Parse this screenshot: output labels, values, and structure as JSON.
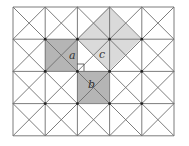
{
  "diagram": {
    "grid": {
      "cols": 5,
      "rows": 4,
      "x0": 13,
      "y0": 7,
      "cell": 32.2,
      "diagonals": true,
      "line_color": "#6e6e6e",
      "dot_color": "#222222"
    },
    "squares": [
      {
        "name": "a",
        "fill": "#b5b5b5",
        "points": "45,39 77,39 77,71 45,71"
      },
      {
        "name": "b",
        "fill": "#b5b5b5",
        "points": "77,71 109,71 109,103 77,103"
      },
      {
        "name": "c",
        "fill": "#dadada",
        "points": "77,39 109,7 141,39 109,71"
      }
    ],
    "labels": [
      {
        "id": "a",
        "text": "a",
        "x": 69,
        "y": 59
      },
      {
        "id": "c",
        "text": "c",
        "x": 99,
        "y": 58
      },
      {
        "id": "b",
        "text": "b",
        "x": 88,
        "y": 88
      }
    ],
    "right_angle_marker": {
      "x": 77,
      "y": 64,
      "size": 7
    }
  }
}
